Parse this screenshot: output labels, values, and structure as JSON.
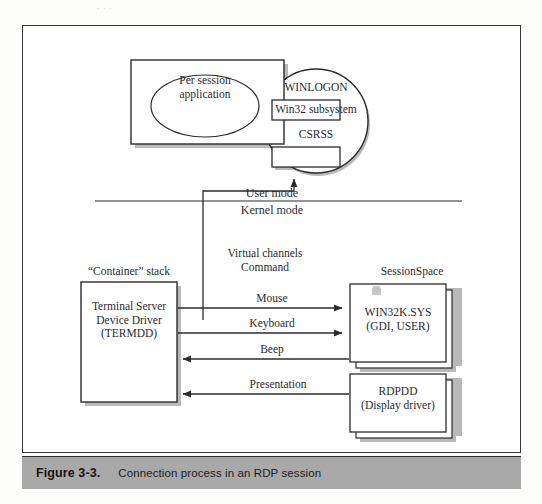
{
  "page": {
    "top_scan_artifact": "· ·  ·"
  },
  "figure": {
    "caption_number": "Figure 3-3.",
    "caption_text": "Connection process in an RDP session",
    "caption_bar_color": "#a9a9a9",
    "border_color": "#35353a"
  },
  "diagram": {
    "type": "architecture-block-diagram",
    "user_mode_label": "User mode",
    "kernel_mode_label": "Kernel mode",
    "per_session_box": {
      "ellipse_line1": "Per session",
      "ellipse_line2": "application"
    },
    "win32_circle": {
      "subsystem_label": "Win32 subsystem",
      "top_box_label": "WINLOGON",
      "bottom_box_label": "CSRSS"
    },
    "container_stack": {
      "title": "“Container” stack",
      "box_line1": "Terminal Server",
      "box_line2": "Device Driver",
      "box_line3": "(TERMDD)"
    },
    "virtual_channels": {
      "line1": "Virtual channels",
      "line2": "Command"
    },
    "session_space": {
      "title": "SessionSpace",
      "win32k_line1": "WIN32K.SYS",
      "win32k_line2": "(GDI, USER)",
      "rdpdd_line1": "RDPDD",
      "rdpdd_line2": "(Display driver)"
    },
    "flows": [
      {
        "label": "Mouse",
        "direction": "right"
      },
      {
        "label": "Keyboard",
        "direction": "right"
      },
      {
        "label": "Beep",
        "direction": "left"
      },
      {
        "label": "Presentation",
        "direction": "left"
      }
    ]
  }
}
